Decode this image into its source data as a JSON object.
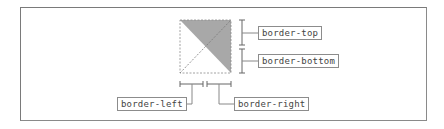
{
  "diagram": {
    "colors": {
      "frame": "#7a7a7a",
      "shaded_triangle": "#a8a8a8",
      "dashed_lines": "#8c8c8c",
      "bracket": "#666666",
      "label_border": "#8c8c8c",
      "label_text": "#444444"
    },
    "labels": {
      "top": "border-top",
      "bottom": "border-bottom",
      "left": "border-left",
      "right": "border-right"
    }
  }
}
